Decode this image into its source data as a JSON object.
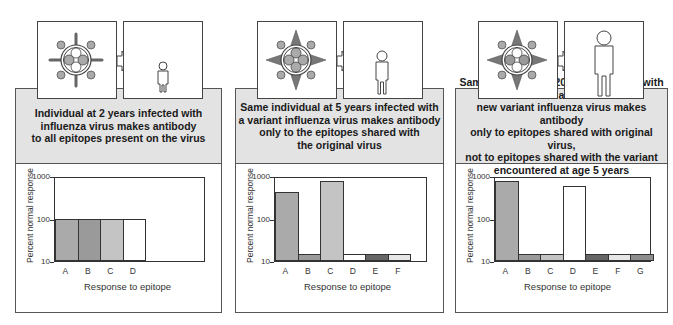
{
  "panels": [
    {
      "caption": "Individual at 2 years infected with\ninfluenza virus makes antibody\nto all epitopes present on the virus",
      "virus_icon": "virus-with-spikes-icon",
      "person_icon": "small-child-icon"
    },
    {
      "caption": "Same individual at 5 years infected with\na variant influenza virus makes antibody\nonly to the epitopes shared with\nthe original virus",
      "virus_icon": "variant-virus-icon",
      "person_icon": "child-icon"
    },
    {
      "caption": "Same individual at 20 years infected with a\nnew variant influenza virus makes antibody\nonly to epitopes shared with original virus,\nnot to epitopes shared with the variant\nencountered at age 5 years",
      "virus_icon": "new-variant-virus-icon",
      "person_icon": "adult-icon"
    }
  ],
  "chart_data": [
    {
      "type": "bar",
      "title": "",
      "xlabel": "Response to epitope",
      "ylabel": "Percent normal response",
      "yscale": "log",
      "ylim": [
        10,
        1000
      ],
      "yticks": [
        "1000",
        "100",
        "10"
      ],
      "categories": [
        "A",
        "B",
        "C",
        "D"
      ],
      "values": [
        100,
        100,
        100,
        100
      ],
      "colors": [
        "#aaaaaa",
        "#9a9a9a",
        "#c4c4c4",
        "#ffffff"
      ]
    },
    {
      "type": "bar",
      "title": "",
      "xlabel": "Response to epitope",
      "ylabel": "Percent normal response",
      "yscale": "log",
      "ylim": [
        10,
        1000
      ],
      "yticks": [
        "1000",
        "100",
        "10"
      ],
      "categories": [
        "A",
        "B",
        "C",
        "D",
        "E",
        "F"
      ],
      "values": [
        450,
        15,
        800,
        15,
        15,
        15
      ],
      "colors": [
        "#aaaaaa",
        "#9a9a9a",
        "#c4c4c4",
        "#ffffff",
        "#666666",
        "#e6e6e6"
      ]
    },
    {
      "type": "bar",
      "title": "",
      "xlabel": "Response to epitope",
      "ylabel": "Percent normal response",
      "yscale": "log",
      "ylim": [
        10,
        1000
      ],
      "yticks": [
        "1000",
        "100",
        "10"
      ],
      "categories": [
        "A",
        "B",
        "C",
        "D",
        "E",
        "F",
        "G"
      ],
      "values": [
        800,
        15,
        15,
        600,
        15,
        15,
        15
      ],
      "colors": [
        "#aaaaaa",
        "#9a9a9a",
        "#c4c4c4",
        "#ffffff",
        "#666666",
        "#e6e6e6",
        "#8e8e8e"
      ]
    }
  ]
}
